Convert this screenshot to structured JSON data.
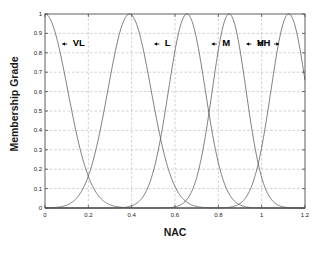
{
  "chart_data": {
    "type": "line",
    "title": "",
    "xlabel": "NAC",
    "ylabel": "Membership Grade",
    "xlim": [
      0,
      1.2
    ],
    "ylim": [
      0,
      1
    ],
    "grid": true,
    "legend_position": "inline-annotations",
    "xticks": [
      "0",
      "0.2",
      "0.4",
      "0.6",
      "0.8",
      "1",
      "1.2"
    ],
    "xtick_values": [
      0,
      0.2,
      0.4,
      0.6,
      0.8,
      1,
      1.2
    ],
    "yticks": [
      "0",
      "0.1",
      "0.2",
      "0.3",
      "0.4",
      "0.5",
      "0.6",
      "0.7",
      "0.8",
      "0.9",
      "1"
    ],
    "ytick_values": [
      0,
      0.1,
      0.2,
      0.3,
      0.4,
      0.5,
      0.6,
      0.7,
      0.8,
      0.9,
      1
    ],
    "line_color": "#555555",
    "grid_color": "#b4b4b4",
    "axis_color": "#4d4d4d",
    "series": [
      {
        "name": "VL",
        "label": "VL",
        "center": 0.0,
        "sigma": 0.105,
        "peak": 1.0,
        "annotation": {
          "text": "VL",
          "x": 0.105,
          "y": 0.845,
          "arrow": "left"
        }
      },
      {
        "name": "L",
        "label": "L",
        "center": 0.39,
        "sigma": 0.1,
        "peak": 1.0,
        "annotation": {
          "text": "L",
          "x": 0.53,
          "y": 0.845,
          "arrow": "left"
        }
      },
      {
        "name": "M",
        "label": "M",
        "center": 0.655,
        "sigma": 0.085,
        "peak": 1.0,
        "annotation": {
          "text": "M",
          "x": 0.795,
          "y": 0.845,
          "arrow": "left"
        }
      },
      {
        "name": "H",
        "label": "H",
        "center": 0.85,
        "sigma": 0.078,
        "peak": 1.0,
        "annotation": {
          "text": "H",
          "x": 0.955,
          "y": 0.845,
          "arrow": "left"
        }
      },
      {
        "name": "VH",
        "label": "VH",
        "center": 1.125,
        "sigma": 0.082,
        "peak": 1.0,
        "annotation": {
          "text": "VH",
          "x": 1.055,
          "y": 0.845,
          "arrow": "right"
        }
      }
    ]
  }
}
